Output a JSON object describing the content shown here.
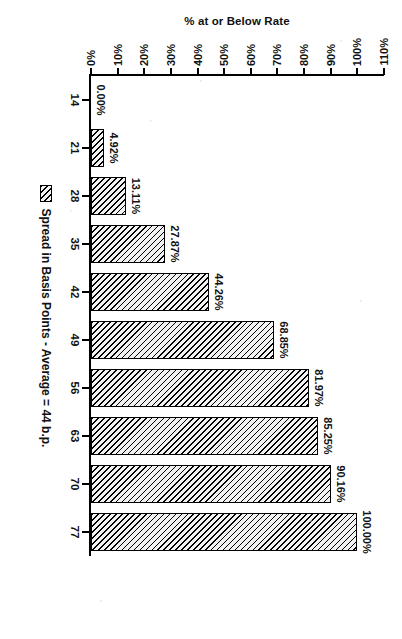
{
  "chart_data": {
    "type": "bar",
    "title": "",
    "subtitle": "",
    "xlabel": "Spread in Basis Points - Average = 44 b.p.",
    "ylabel": "% at or Below Rate",
    "categories": [
      "14",
      "21",
      "28",
      "35",
      "42",
      "49",
      "56",
      "63",
      "70",
      "77"
    ],
    "values": [
      0.0,
      4.92,
      13.11,
      27.87,
      44.26,
      68.85,
      81.97,
      85.25,
      90.16,
      100.0
    ],
    "data_labels": [
      "0.00%",
      "4.92%",
      "13.11%",
      "27.87%",
      "44.26%",
      "68.85%",
      "81.97%",
      "85.25%",
      "90.16%",
      "100.00%"
    ],
    "ylim": [
      0,
      110
    ],
    "ytick_values": [
      0,
      10,
      20,
      30,
      40,
      50,
      60,
      70,
      80,
      90,
      100,
      110
    ],
    "ytick_labels": [
      "0%",
      "10%",
      "20%",
      "30%",
      "40%",
      "50%",
      "60%",
      "70%",
      "80%",
      "90%",
      "100%",
      "110%"
    ],
    "grid": false,
    "legend_position": "bottom",
    "series": [
      {
        "name": "Spread in Basis Points - Average = 44 b.p.",
        "values": [
          0.0,
          4.92,
          13.11,
          27.87,
          44.26,
          68.85,
          81.97,
          85.25,
          90.16,
          100.0
        ]
      }
    ],
    "fill_pattern": "diagonal-hatch",
    "colors": {
      "bar_fill": "#f2f2f2",
      "bar_hatch": "#000000",
      "bar_border": "#000000",
      "axis": "#000000",
      "text": "#111111",
      "background": "#ffffff"
    },
    "page_rotation_degrees": 90,
    "ylabel_rotation_degrees": 180
  },
  "legend": {
    "label": "Spread in Basis Points - Average = 44 b.p."
  }
}
